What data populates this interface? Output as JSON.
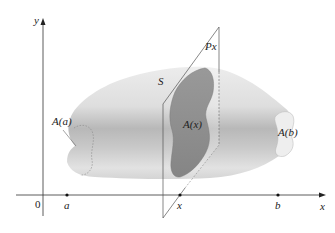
{
  "figure": {
    "axes": {
      "y_label": "y",
      "x_label": "x",
      "origin_label": "0"
    },
    "points": [
      {
        "id": "a",
        "label": "a"
      },
      {
        "id": "x",
        "label": "x"
      },
      {
        "id": "b",
        "label": "b"
      }
    ],
    "solid_label": "S",
    "plane_label": "P",
    "plane_subscript": "x",
    "cross_sections": {
      "left": "A(a)",
      "middle": "A(x)",
      "right": "A(b)"
    },
    "colors": {
      "solid_light": "#e4e4e4",
      "solid_dark": "#b0b0b0",
      "cross_section": "#8e8e8e",
      "end_cap": "#ececec",
      "axis": "#333333",
      "plane_line": "#555555"
    }
  }
}
